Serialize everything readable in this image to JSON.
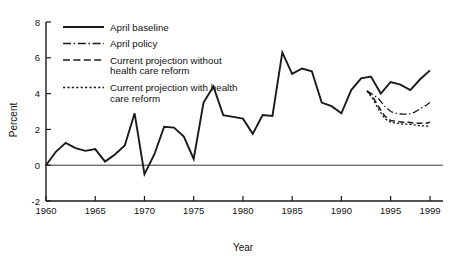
{
  "chart_data": {
    "type": "line",
    "title": "",
    "xlabel": "Year",
    "ylabel": "Percent",
    "xlim": [
      1960,
      1999
    ],
    "ylim": [
      -2,
      8
    ],
    "xticks": [
      1960,
      1965,
      1970,
      1975,
      1980,
      1985,
      1990,
      1995,
      1999
    ],
    "xtick_labels": [
      "1960",
      "1965",
      "1970",
      "1975",
      "1980",
      "1985",
      "1990",
      "1995",
      "1999"
    ],
    "yticks": [
      -2,
      0,
      2,
      4,
      6,
      8
    ],
    "ytick_labels": [
      "-2",
      "0",
      "2",
      "4",
      "6",
      "8"
    ],
    "grid": false,
    "legend_position": "top-left-inside",
    "zero_reference_line": true,
    "series": [
      {
        "name": "April baseline",
        "style": "solid",
        "x": [
          1960,
          1961,
          1962,
          1963,
          1964,
          1965,
          1966,
          1967,
          1968,
          1969,
          1970,
          1971,
          1972,
          1973,
          1974,
          1975,
          1976,
          1977,
          1978,
          1979,
          1980,
          1981,
          1982,
          1983,
          1984,
          1985,
          1986,
          1987,
          1988,
          1989,
          1990,
          1991,
          1992,
          1993,
          1994,
          1995,
          1996,
          1997,
          1998,
          1999
        ],
        "values": [
          0.0,
          0.75,
          1.25,
          0.95,
          0.8,
          0.9,
          0.2,
          0.6,
          1.1,
          2.9,
          -0.5,
          0.6,
          2.15,
          2.1,
          1.6,
          0.35,
          3.5,
          4.4,
          2.8,
          2.7,
          2.6,
          1.75,
          2.8,
          2.75,
          6.3,
          5.1,
          5.4,
          5.25,
          3.5,
          3.3,
          2.9,
          4.2,
          4.85,
          4.95,
          4.0,
          4.65,
          4.5,
          4.2,
          4.8,
          5.3
        ]
      },
      {
        "name": "April policy",
        "style": "dash-dot",
        "x": [
          1992.6,
          1993.2,
          1993.8,
          1994.4,
          1995,
          1995.6,
          1996.2,
          1996.8,
          1997.4,
          1998,
          1998.6,
          1999
        ],
        "values": [
          4.15,
          3.95,
          3.7,
          3.3,
          3.0,
          2.9,
          2.85,
          2.85,
          2.95,
          3.15,
          3.35,
          3.5
        ]
      },
      {
        "name": "Current projection without health care reform",
        "style": "long-dash",
        "x": [
          1992.6,
          1993.2,
          1993.8,
          1994.4,
          1995,
          1995.6,
          1996.2,
          1996.8,
          1997.4,
          1998,
          1998.6,
          1999
        ],
        "values": [
          4.15,
          3.8,
          3.25,
          2.75,
          2.5,
          2.45,
          2.4,
          2.4,
          2.35,
          2.35,
          2.35,
          2.4
        ]
      },
      {
        "name": "Current projection with health care reform",
        "style": "dotted",
        "x": [
          1992.6,
          1993.2,
          1993.8,
          1994.4,
          1995,
          1995.6,
          1996.2,
          1996.8,
          1997.4,
          1998,
          1998.6,
          1999
        ],
        "values": [
          4.15,
          3.7,
          3.1,
          2.6,
          2.4,
          2.35,
          2.3,
          2.3,
          2.25,
          2.2,
          2.2,
          2.15
        ]
      }
    ]
  },
  "legend": {
    "entries": [
      {
        "label": "April baseline",
        "style": "solid"
      },
      {
        "label": "April policy",
        "style": "dash-dot"
      },
      {
        "label_line1": "Current projection without",
        "label_line2": "health care reform",
        "style": "long-dash"
      },
      {
        "label_line1": "Current projection with health",
        "label_line2": "care reform",
        "style": "dotted"
      }
    ]
  },
  "colors": {
    "ink": "#1a1a1a",
    "background": "#ffffff"
  }
}
